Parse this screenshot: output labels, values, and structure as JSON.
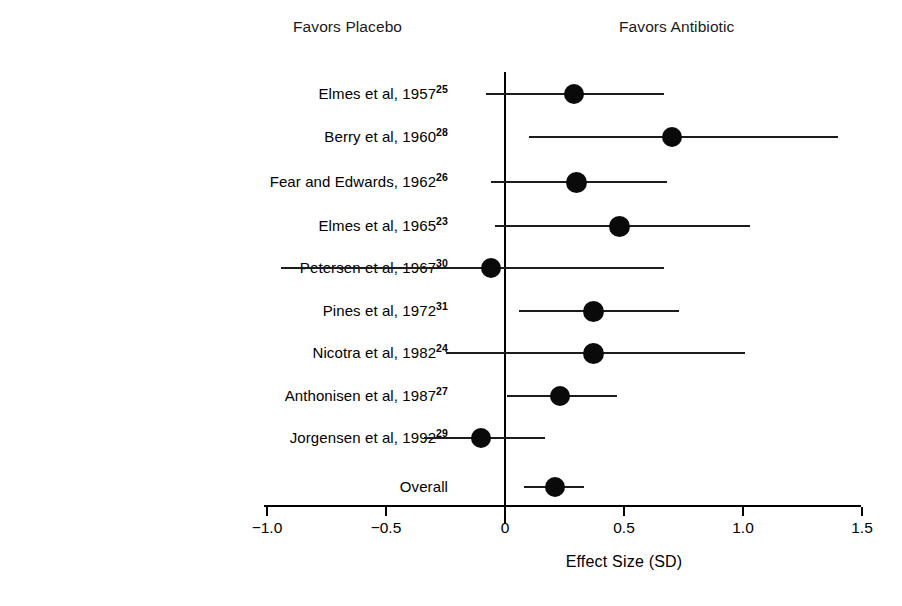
{
  "headers": {
    "left": "Favors Placebo",
    "right": "Favors Antibiotic"
  },
  "axis": {
    "title": "Effect Size (SD)",
    "ticks": [
      "−1.0",
      "−0.5",
      "0",
      "0.5",
      "1.0",
      "1.5"
    ],
    "tick_values": [
      -1.0,
      -0.5,
      0,
      0.5,
      1.0,
      1.5
    ]
  },
  "chart_data": {
    "type": "scatter",
    "title": "",
    "subtitle": "",
    "xlabel": "Effect Size (SD)",
    "ylabel": "",
    "xlim": [
      -1.0,
      1.5
    ],
    "xticks": [
      -1.0,
      -0.5,
      0,
      0.5,
      1.0,
      1.5
    ],
    "xticklabels": [
      "-1.0",
      "-0.5",
      "0",
      "0.5",
      "1.0",
      "1.5"
    ],
    "grid": false,
    "legend": null,
    "reference_line": 0,
    "annotations": [
      "Favors Placebo",
      "Favors Antibiotic"
    ],
    "categories": [
      "Elmes et al, 1957",
      "Berry et al, 1960",
      "Fear and Edwards, 1962",
      "Elmes et al, 1965",
      "Petersen et al, 1967",
      "Pines et al, 1972",
      "Nicotra et al, 1982",
      "Anthonisen et al, 1987",
      "Jorgensen et al, 1992",
      "Overall"
    ],
    "rows": [
      {
        "label": "Elmes et al, 1957",
        "name": "Elmes et al",
        "year": "1957",
        "ref": "25",
        "estimate": 0.29,
        "ci_low": -0.08,
        "ci_high": 0.67,
        "marker_size": 20,
        "is_overall": false
      },
      {
        "label": "Berry et al, 1960",
        "name": "Berry et al",
        "year": "1960",
        "ref": "28",
        "estimate": 0.7,
        "ci_low": 0.1,
        "ci_high": 1.4,
        "marker_size": 20,
        "is_overall": false
      },
      {
        "label": "Fear and Edwards, 1962",
        "name": "Fear and Edwards",
        "year": "1962",
        "ref": "26",
        "estimate": 0.3,
        "ci_low": -0.06,
        "ci_high": 0.68,
        "marker_size": 21,
        "is_overall": false
      },
      {
        "label": "Elmes et al, 1965",
        "name": "Elmes et al",
        "year": "1965",
        "ref": "23",
        "estimate": 0.48,
        "ci_low": -0.04,
        "ci_high": 1.03,
        "marker_size": 21,
        "is_overall": false
      },
      {
        "label": "Petersen et al, 1967",
        "name": "Petersen et al",
        "year": "1967",
        "ref": "30",
        "estimate": -0.06,
        "ci_low": -0.94,
        "ci_high": 0.67,
        "marker_size": 20,
        "is_overall": false
      },
      {
        "label": "Pines et al, 1972",
        "name": "Pines et al",
        "year": "1972",
        "ref": "31",
        "estimate": 0.37,
        "ci_low": 0.06,
        "ci_high": 0.73,
        "marker_size": 21,
        "is_overall": false
      },
      {
        "label": "Nicotra et al, 1982",
        "name": "Nicotra et al",
        "year": "1982",
        "ref": "24",
        "estimate": 0.37,
        "ci_low": -0.25,
        "ci_high": 1.01,
        "marker_size": 21,
        "is_overall": false
      },
      {
        "label": "Anthonisen et al, 1987",
        "name": "Anthonisen et al",
        "year": "1987",
        "ref": "27",
        "estimate": 0.23,
        "ci_low": 0.01,
        "ci_high": 0.47,
        "marker_size": 20,
        "is_overall": false
      },
      {
        "label": "Jorgensen et al, 1992",
        "name": "Jorgensen et al",
        "year": "1992",
        "ref": "29",
        "estimate": -0.1,
        "ci_low": -0.34,
        "ci_high": 0.17,
        "marker_size": 20,
        "is_overall": false
      },
      {
        "label": "Overall",
        "name": "Overall",
        "year": "",
        "ref": "",
        "estimate": 0.21,
        "ci_low": 0.08,
        "ci_high": 0.33,
        "marker_size": 20,
        "is_overall": true
      }
    ]
  },
  "geometry": {
    "x_zero_px": 505,
    "px_per_unit": 238,
    "row_y": [
      94,
      137,
      182,
      226,
      268,
      311,
      353,
      396,
      438,
      487
    ],
    "axis_y": 505,
    "axis_x_start": 264,
    "axis_x_end": 861,
    "zero_line_top": 72,
    "zero_line_bottom": 523,
    "label_right_edge": 448
  },
  "colors": {
    "marker": "#0a0a0a",
    "line": "#1c1c1c",
    "axis": "#000000",
    "text": "#000000",
    "background": "#ffffff"
  }
}
